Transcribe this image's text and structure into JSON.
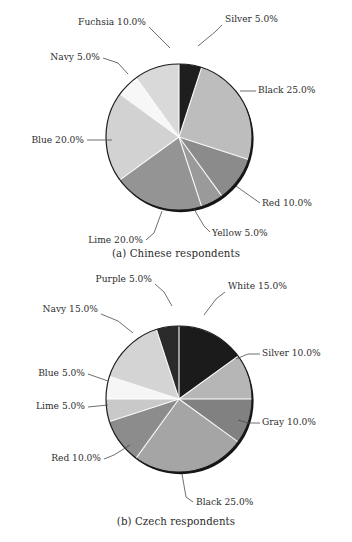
{
  "figure": {
    "background": "#ffffff",
    "text_color": "#2e2e2e",
    "label_suffix": "%"
  },
  "charts": [
    {
      "id": "a",
      "caption": "(a) Chinese respondents",
      "center": {
        "x": 179,
        "y": 137
      },
      "radius": 73,
      "start_angle_deg": -90,
      "direction": "clockwise",
      "slices": [
        {
          "label": "Silver 5.0%",
          "name": "Silver",
          "value": 5.0,
          "color": "#1e1e1e",
          "label_x": 225,
          "label_y": 22,
          "anchor": "start",
          "leader": [
            [
              222,
              25
            ],
            [
              215,
              32
            ],
            [
              198,
              46
            ]
          ]
        },
        {
          "label": "Black 25.0%",
          "name": "Black",
          "value": 25.0,
          "color": "#bdbdbd",
          "label_x": 258,
          "label_y": 93,
          "anchor": "start",
          "leader": [
            [
              256,
              91
            ],
            [
              240,
              91
            ]
          ]
        },
        {
          "label": "Red 10.0%",
          "name": "Red",
          "value": 10.0,
          "color": "#8b8b8b",
          "label_x": 262,
          "label_y": 206,
          "anchor": "start",
          "leader": [
            [
              260,
              203
            ],
            [
              250,
              196
            ],
            [
              236,
              186
            ]
          ]
        },
        {
          "label": "Yellow 5.0%",
          "name": "Yellow",
          "value": 5.0,
          "color": "#9a9a9a",
          "label_x": 212,
          "label_y": 236,
          "anchor": "start",
          "leader": [
            [
              210,
              232
            ],
            [
              204,
              226
            ],
            [
              194,
              209
            ]
          ]
        },
        {
          "label": "Lime 20.0%",
          "name": "Lime",
          "value": 20.0,
          "color": "#949494",
          "label_x": 143,
          "label_y": 243,
          "anchor": "end",
          "leader": [
            [
              146,
              240
            ],
            [
              154,
              233
            ],
            [
              162,
              211
            ]
          ]
        },
        {
          "label": "Blue 20.0%",
          "name": "Blue",
          "value": 20.0,
          "color": "#d2d2d2",
          "label_x": 84,
          "label_y": 143,
          "anchor": "end",
          "leader": [
            [
              87,
              140
            ],
            [
              112,
              140
            ]
          ]
        },
        {
          "label": "Navy 5.0%",
          "name": "Navy",
          "value": 5.0,
          "color": "#f7f7f7",
          "label_x": 100,
          "label_y": 60,
          "anchor": "end",
          "leader": [
            [
              103,
              58
            ],
            [
              118,
              63
            ],
            [
              128,
              74
            ]
          ]
        },
        {
          "label": "Fuchsia 10.0%",
          "name": "Fuchsia",
          "value": 10.0,
          "color": "#d9d9d9",
          "label_x": 146,
          "label_y": 25,
          "anchor": "end",
          "leader": [
            [
              149,
              27
            ],
            [
              158,
              36
            ],
            [
              170,
              48
            ]
          ]
        }
      ]
    },
    {
      "id": "b",
      "caption": "(b) Czech respondents",
      "center": {
        "x": 179,
        "y": 137
      },
      "radius": 73,
      "start_angle_deg": -90,
      "direction": "clockwise",
      "slices": [
        {
          "label": "White 15.0%",
          "name": "White",
          "value": 15.0,
          "color": "#1b1b1b",
          "label_x": 228,
          "label_y": 27,
          "anchor": "start",
          "leader": [
            [
              225,
              30
            ],
            [
              216,
              37
            ],
            [
              204,
              53
            ]
          ]
        },
        {
          "label": "Silver 10.0%",
          "name": "Silver",
          "value": 10.0,
          "color": "#b6b6b6",
          "label_x": 262,
          "label_y": 94,
          "anchor": "start",
          "leader": [
            [
              260,
              92
            ],
            [
              248,
              92
            ],
            [
              236,
              97
            ]
          ]
        },
        {
          "label": "Gray 10.0%",
          "name": "Gray",
          "value": 10.0,
          "color": "#818181",
          "label_x": 262,
          "label_y": 163,
          "anchor": "start",
          "leader": [
            [
              260,
              161
            ],
            [
              248,
              161
            ],
            [
              238,
              158
            ]
          ]
        },
        {
          "label": "Black 25.0%",
          "name": "Black",
          "value": 25.0,
          "color": "#a5a5a5",
          "label_x": 196,
          "label_y": 243,
          "anchor": "start",
          "leader": [
            [
              193,
              240
            ],
            [
              186,
              235
            ],
            [
              182,
              212
            ]
          ]
        },
        {
          "label": "Red 10.0%",
          "name": "Red",
          "value": 10.0,
          "color": "#8c8c8c",
          "label_x": 101,
          "label_y": 199,
          "anchor": "end",
          "leader": [
            [
              104,
              197
            ],
            [
              114,
              193
            ],
            [
              130,
              183
            ]
          ]
        },
        {
          "label": "Lime 5.0%",
          "name": "Lime",
          "value": 5.0,
          "color": "#c9c9c9",
          "label_x": 85,
          "label_y": 147,
          "anchor": "end",
          "leader": [
            [
              88,
              145
            ],
            [
              108,
              143
            ]
          ]
        },
        {
          "label": "Blue 5.0%",
          "name": "Blue",
          "value": 5.0,
          "color": "#f6f6f6",
          "label_x": 85,
          "label_y": 114,
          "anchor": "end",
          "leader": [
            [
              88,
              112
            ],
            [
              108,
              119
            ]
          ]
        },
        {
          "label": "Navy 15.0%",
          "name": "Navy",
          "value": 15.0,
          "color": "#d4d4d4",
          "label_x": 98,
          "label_y": 50,
          "anchor": "end",
          "leader": [
            [
              101,
              52
            ],
            [
              118,
              59
            ],
            [
              133,
              71
            ]
          ]
        },
        {
          "label": "Purple 5.0%",
          "name": "Purple",
          "value": 5.0,
          "color": "#2a2a2a",
          "label_x": 152,
          "label_y": 20,
          "anchor": "end",
          "leader": [
            [
              155,
              22
            ],
            [
              164,
              30
            ],
            [
              172,
              44
            ]
          ]
        }
      ]
    }
  ],
  "chart_data": [
    {
      "type": "pie",
      "title": "(a) Chinese respondents",
      "xlabel": "",
      "ylabel": "",
      "legend_position": "outside-labels",
      "grid": false,
      "categories": [
        "Silver",
        "Black",
        "Red",
        "Yellow",
        "Lime",
        "Blue",
        "Navy",
        "Fuchsia"
      ],
      "values": [
        5.0,
        25.0,
        10.0,
        5.0,
        20.0,
        20.0,
        5.0,
        10.0
      ],
      "value_unit": "percent",
      "data_labels": [
        "Silver 5.0%",
        "Black 25.0%",
        "Red 10.0%",
        "Yellow 5.0%",
        "Lime 20.0%",
        "Blue 20.0%",
        "Navy 5.0%",
        "Fuchsia 10.0%"
      ],
      "slice_fills": [
        "#1e1e1e",
        "#bdbdbd",
        "#8b8b8b",
        "#9a9a9a",
        "#949494",
        "#d2d2d2",
        "#f7f7f7",
        "#d9d9d9"
      ],
      "total": 100.0
    },
    {
      "type": "pie",
      "title": "(b) Czech respondents",
      "xlabel": "",
      "ylabel": "",
      "legend_position": "outside-labels",
      "grid": false,
      "categories": [
        "White",
        "Silver",
        "Gray",
        "Black",
        "Red",
        "Lime",
        "Blue",
        "Navy",
        "Purple"
      ],
      "values": [
        15.0,
        10.0,
        10.0,
        25.0,
        10.0,
        5.0,
        5.0,
        15.0,
        5.0
      ],
      "value_unit": "percent",
      "data_labels": [
        "White 15.0%",
        "Silver 10.0%",
        "Gray 10.0%",
        "Black 25.0%",
        "Red 10.0%",
        "Lime 5.0%",
        "Blue 5.0%",
        "Navy 15.0%",
        "Purple 5.0%"
      ],
      "slice_fills": [
        "#1b1b1b",
        "#b6b6b6",
        "#818181",
        "#a5a5a5",
        "#8c8c8c",
        "#c9c9c9",
        "#f6f6f6",
        "#d4d4d4",
        "#2a2a2a"
      ],
      "total": 100.0
    }
  ]
}
